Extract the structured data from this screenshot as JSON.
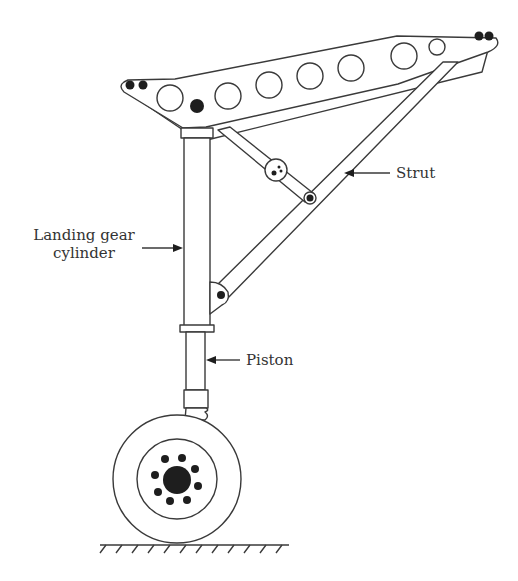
{
  "figure": {
    "labels": {
      "strut": "Strut",
      "cylinder_line1": "Landing gear",
      "cylinder_line2": "cylinder",
      "piston": "Piston"
    },
    "colors": {
      "stroke": "#3a3a3a",
      "fill_dark": "#1e1e1e",
      "text": "#333333",
      "background": "#ffffff"
    }
  }
}
